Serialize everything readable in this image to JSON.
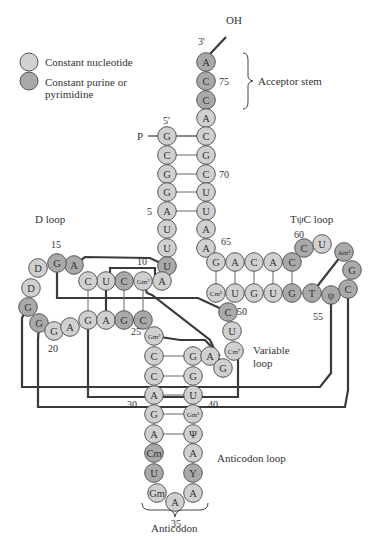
{
  "legend": {
    "items": [
      {
        "label": "Constant nucleotide",
        "color": "#d0d0d0"
      },
      {
        "label": "Constant purine or pyrimidine",
        "color": "#a9a9a9"
      }
    ],
    "line1": "Constant nucleotide",
    "line2a": "Constant purine or",
    "line2b": "pyrimidine"
  },
  "colors": {
    "constant": "#d0d0d0",
    "purine_pyrimidine": "#a9a9a9",
    "plain": "#e6e6e6",
    "stroke": "#555555",
    "tertiary_line": "#3a3a3a"
  },
  "labels": {
    "oh": "OH",
    "three_prime": "3'",
    "five_prime": "5'",
    "phosphate": "P",
    "acceptor_stem": "Acceptor stem",
    "d_loop": "D loop",
    "tpsic_loop": "TψC loop",
    "variable_loop_1": "Variable",
    "variable_loop_2": "loop",
    "anticodon_loop": "Anticodon loop",
    "anticodon": "Anticodon"
  },
  "position_numbers": [
    {
      "text": "75",
      "x": 219,
      "y": 85
    },
    {
      "text": "70",
      "x": 219,
      "y": 178
    },
    {
      "text": "5",
      "x": 147,
      "y": 215
    },
    {
      "text": "65",
      "x": 221,
      "y": 245
    },
    {
      "text": "60",
      "x": 294,
      "y": 238
    },
    {
      "text": "15",
      "x": 51,
      "y": 248
    },
    {
      "text": "10",
      "x": 137,
      "y": 265
    },
    {
      "text": "50",
      "x": 237,
      "y": 315
    },
    {
      "text": "55",
      "x": 313,
      "y": 320
    },
    {
      "text": "20",
      "x": 48,
      "y": 352
    },
    {
      "text": "25",
      "x": 131,
      "y": 335
    },
    {
      "text": "30",
      "x": 127,
      "y": 408
    },
    {
      "text": "40",
      "x": 208,
      "y": 408
    },
    {
      "text": "35",
      "x": 171,
      "y": 527
    }
  ],
  "nucleotides": [
    {
      "b": "A",
      "x": 206,
      "y": 62,
      "t": "c"
    },
    {
      "b": "C",
      "x": 206,
      "y": 81,
      "t": "c"
    },
    {
      "b": "C",
      "x": 206,
      "y": 100,
      "t": "c"
    },
    {
      "b": "A",
      "x": 206,
      "y": 118,
      "t": "p"
    },
    {
      "b": "C",
      "x": 206,
      "y": 136,
      "t": "p"
    },
    {
      "b": "G",
      "x": 167,
      "y": 136,
      "t": "p"
    },
    {
      "b": "C",
      "x": 167,
      "y": 155,
      "t": "p"
    },
    {
      "b": "G",
      "x": 206,
      "y": 155,
      "t": "p"
    },
    {
      "b": "G",
      "x": 167,
      "y": 174,
      "t": "p"
    },
    {
      "b": "C",
      "x": 206,
      "y": 174,
      "t": "p"
    },
    {
      "b": "G",
      "x": 167,
      "y": 192,
      "t": "p"
    },
    {
      "b": "U",
      "x": 206,
      "y": 192,
      "t": "p"
    },
    {
      "b": "A",
      "x": 167,
      "y": 211,
      "t": "p"
    },
    {
      "b": "U",
      "x": 206,
      "y": 211,
      "t": "p"
    },
    {
      "b": "U",
      "x": 167,
      "y": 229,
      "t": "p"
    },
    {
      "b": "A",
      "x": 206,
      "y": 229,
      "t": "p"
    },
    {
      "b": "U",
      "x": 167,
      "y": 248,
      "t": "p"
    },
    {
      "b": "A",
      "x": 206,
      "y": 248,
      "t": "p"
    },
    {
      "b": "U",
      "x": 167,
      "y": 266,
      "t": "c"
    },
    {
      "b": "A",
      "x": 162,
      "y": 281,
      "t": "p"
    },
    {
      "b": "Gm²",
      "x": 143,
      "y": 281,
      "t": "p",
      "small": true
    },
    {
      "b": "C",
      "x": 124,
      "y": 281,
      "t": "c"
    },
    {
      "b": "U",
      "x": 106,
      "y": 281,
      "t": "p"
    },
    {
      "b": "C",
      "x": 88,
      "y": 281,
      "t": "p"
    },
    {
      "b": "A",
      "x": 74,
      "y": 265,
      "t": "c"
    },
    {
      "b": "G",
      "x": 57,
      "y": 263,
      "t": "c"
    },
    {
      "b": "D",
      "x": 38,
      "y": 268,
      "t": "p"
    },
    {
      "b": "D",
      "x": 31,
      "y": 288,
      "t": "p"
    },
    {
      "b": "G",
      "x": 28,
      "y": 307,
      "t": "c"
    },
    {
      "b": "G",
      "x": 39,
      "y": 323,
      "t": "c"
    },
    {
      "b": "G",
      "x": 54,
      "y": 331,
      "t": "p"
    },
    {
      "b": "A",
      "x": 70,
      "y": 327,
      "t": "p"
    },
    {
      "b": "G",
      "x": 88,
      "y": 320,
      "t": "p"
    },
    {
      "b": "A",
      "x": 106,
      "y": 320,
      "t": "p"
    },
    {
      "b": "G",
      "x": 124,
      "y": 320,
      "t": "c"
    },
    {
      "b": "C",
      "x": 143,
      "y": 320,
      "t": "c"
    },
    {
      "b": "Gm²",
      "x": 154,
      "y": 336,
      "t": "p",
      "small": true
    },
    {
      "b": "C",
      "x": 154,
      "y": 356,
      "t": "p"
    },
    {
      "b": "C",
      "x": 154,
      "y": 376,
      "t": "p"
    },
    {
      "b": "A",
      "x": 154,
      "y": 395,
      "t": "p"
    },
    {
      "b": "G",
      "x": 154,
      "y": 414,
      "t": "p"
    },
    {
      "b": "A",
      "x": 154,
      "y": 434,
      "t": "p"
    },
    {
      "b": "Cm",
      "x": 154,
      "y": 453,
      "t": "c"
    },
    {
      "b": "U",
      "x": 154,
      "y": 473,
      "t": "c"
    },
    {
      "b": "Gm",
      "x": 157,
      "y": 493,
      "t": "p"
    },
    {
      "b": "A",
      "x": 175,
      "y": 502,
      "t": "p"
    },
    {
      "b": "A",
      "x": 193,
      "y": 493,
      "t": "p"
    },
    {
      "b": "Y",
      "x": 193,
      "y": 473,
      "t": "c"
    },
    {
      "b": "A",
      "x": 193,
      "y": 453,
      "t": "p"
    },
    {
      "b": "Ψ",
      "x": 193,
      "y": 434,
      "t": "p"
    },
    {
      "b": "Gm¹",
      "x": 193,
      "y": 414,
      "t": "p",
      "small": true
    },
    {
      "b": "U",
      "x": 193,
      "y": 395,
      "t": "p"
    },
    {
      "b": "G",
      "x": 193,
      "y": 376,
      "t": "p"
    },
    {
      "b": "G",
      "x": 193,
      "y": 356,
      "t": "p"
    },
    {
      "b": "A",
      "x": 210,
      "y": 356,
      "t": "p"
    },
    {
      "b": "G",
      "x": 223,
      "y": 368,
      "t": "p"
    },
    {
      "b": "Cm⁷",
      "x": 234,
      "y": 351,
      "t": "p",
      "small": true
    },
    {
      "b": "U",
      "x": 232,
      "y": 331,
      "t": "p"
    },
    {
      "b": "C",
      "x": 228,
      "y": 312,
      "t": "c"
    },
    {
      "b": "Cm⁵",
      "x": 216,
      "y": 293,
      "t": "p",
      "small": true
    },
    {
      "b": "U",
      "x": 235,
      "y": 293,
      "t": "p"
    },
    {
      "b": "G",
      "x": 254,
      "y": 293,
      "t": "p"
    },
    {
      "b": "U",
      "x": 273,
      "y": 293,
      "t": "p"
    },
    {
      "b": "G",
      "x": 292,
      "y": 293,
      "t": "c"
    },
    {
      "b": "T",
      "x": 312,
      "y": 293,
      "t": "c"
    },
    {
      "b": "ψ",
      "x": 331,
      "y": 295,
      "t": "c"
    },
    {
      "b": "C",
      "x": 348,
      "y": 289,
      "t": "c"
    },
    {
      "b": "G",
      "x": 352,
      "y": 270,
      "t": "c"
    },
    {
      "b": "Am¹",
      "x": 344,
      "y": 252,
      "t": "c",
      "small": true
    },
    {
      "b": "U",
      "x": 322,
      "y": 244,
      "t": "p"
    },
    {
      "b": "C",
      "x": 304,
      "y": 248,
      "t": "c"
    },
    {
      "b": "C",
      "x": 292,
      "y": 262,
      "t": "c"
    },
    {
      "b": "A",
      "x": 273,
      "y": 262,
      "t": "p"
    },
    {
      "b": "C",
      "x": 254,
      "y": 262,
      "t": "p"
    },
    {
      "b": "A",
      "x": 235,
      "y": 262,
      "t": "p"
    },
    {
      "b": "G",
      "x": 216,
      "y": 262,
      "t": "p"
    }
  ]
}
